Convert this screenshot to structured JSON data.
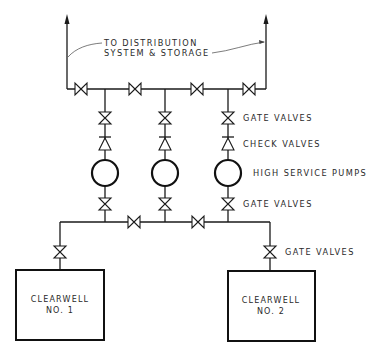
{
  "diagram": {
    "title_annotation": {
      "line1": "TO DISTRIBUTION",
      "line2": "SYSTEM & STORAGE"
    },
    "labels": {
      "upper_gate_valves": "GATE VALVES",
      "check_valves": "CHECK VALVES",
      "pumps": "HIGH SERVICE PUMPS",
      "lower_gate_valves": "GATE VALVES",
      "clearwell_gate_valves": "GATE VALVES"
    },
    "clearwells": [
      {
        "line1": "CLEARWELL",
        "line2": "NO. 1"
      },
      {
        "line1": "CLEARWELL",
        "line2": "NO. 2"
      }
    ],
    "pump_count": 3,
    "colors": {
      "line": "#1a1a1a",
      "background": "#ffffff",
      "text": "#2a2a2a"
    }
  }
}
